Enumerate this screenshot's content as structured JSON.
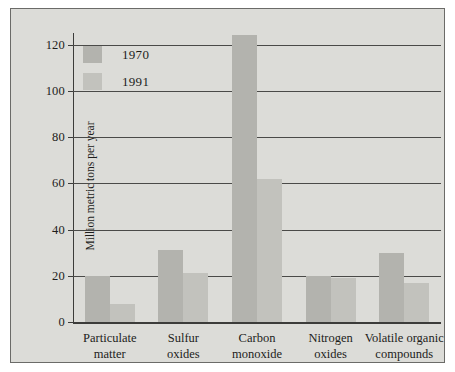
{
  "chart_data": {
    "type": "bar",
    "title": "",
    "xlabel": "",
    "ylabel": "Million metric tons per year",
    "ylim": [
      0,
      125
    ],
    "yticks": [
      0,
      20,
      40,
      60,
      80,
      100,
      120
    ],
    "ytick_labels": [
      "0",
      "20",
      "40",
      "60",
      "80",
      "100",
      "120"
    ],
    "grid": true,
    "legend_position": "top-left",
    "categories": [
      "Particulate matter",
      "Sulfur oxides",
      "Carbon monoxide",
      "Nitrogen oxides",
      "Volatile organic compounds"
    ],
    "category_lines": [
      [
        "Particulate",
        "matter"
      ],
      [
        "Sulfur",
        "oxides"
      ],
      [
        "Carbon",
        "monoxide"
      ],
      [
        "Nitrogen",
        "oxides"
      ],
      [
        "Volatile organic",
        "compounds"
      ]
    ],
    "series": [
      {
        "name": "1970",
        "color": "#b3b3ae",
        "values": [
          20,
          31,
          124,
          20,
          30
        ]
      },
      {
        "name": "1991",
        "color": "#c2c2bd",
        "values": [
          8,
          21,
          62,
          19,
          17
        ]
      }
    ]
  },
  "legend": {
    "items": [
      {
        "label": "1970"
      },
      {
        "label": "1991"
      }
    ]
  },
  "colors": {
    "panel_background": "#dcdcd8",
    "panel_border": "#6b6b68",
    "axis": "#3c3c3a",
    "gridline": "#4a4a48",
    "series_1970": "#b3b3ae",
    "series_1991": "#c2c2bd",
    "text": "#1d1d1b"
  }
}
